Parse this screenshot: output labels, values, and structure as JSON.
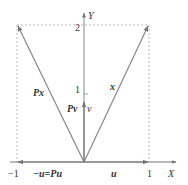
{
  "diagram": {
    "axes": {
      "x_label": "X",
      "y_label": "Y",
      "x_ticks": [
        {
          "value": "-1",
          "label": "−1"
        },
        {
          "value": "1",
          "label": "1"
        }
      ],
      "y_ticks": [
        {
          "value": "1",
          "label": "1"
        },
        {
          "value": "2",
          "label": "2"
        }
      ]
    },
    "vectors": {
      "x": {
        "label": "x",
        "from": [
          0,
          0
        ],
        "to": [
          1,
          2
        ]
      },
      "Px": {
        "label": "Px",
        "from": [
          0,
          0
        ],
        "to": [
          -1,
          2
        ]
      },
      "v": {
        "label": "v",
        "pv_label": "Pv",
        "from": [
          0,
          0
        ],
        "to": [
          0,
          0.85
        ]
      },
      "u": {
        "label": "u",
        "from": [
          0,
          0
        ],
        "to": [
          1,
          0
        ]
      },
      "neg_u": {
        "label": "−u=Pu",
        "from": [
          0,
          0
        ],
        "to": [
          -1,
          0
        ]
      }
    },
    "colors": {
      "line": "#888888",
      "text": "#333333",
      "dashed": "#aaaaaa"
    }
  }
}
